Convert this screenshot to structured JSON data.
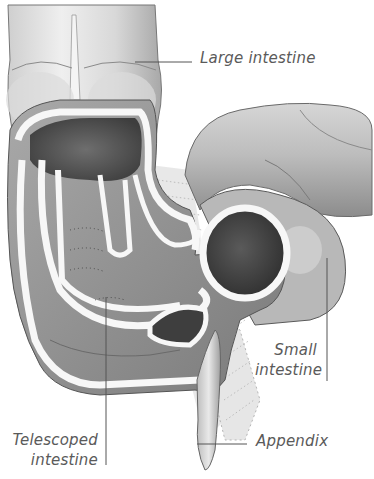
{
  "diagram": {
    "labels": {
      "large_intestine": "Large intestine",
      "small_intestine_line1": "Small",
      "small_intestine_line2": "intestine",
      "telescoped_line1": "Telescoped",
      "telescoped_line2": "intestine",
      "appendix": "Appendix"
    },
    "colors": {
      "background": "#ffffff",
      "tissue_light": "#e6e6e6",
      "tissue_mid": "#bdbdbd",
      "tissue_dark": "#5e5e5e",
      "wall_white": "#f7f7f7",
      "outline": "#4a4a4a",
      "label_text": "#5a5a5a",
      "leader_line": "#555555"
    }
  }
}
